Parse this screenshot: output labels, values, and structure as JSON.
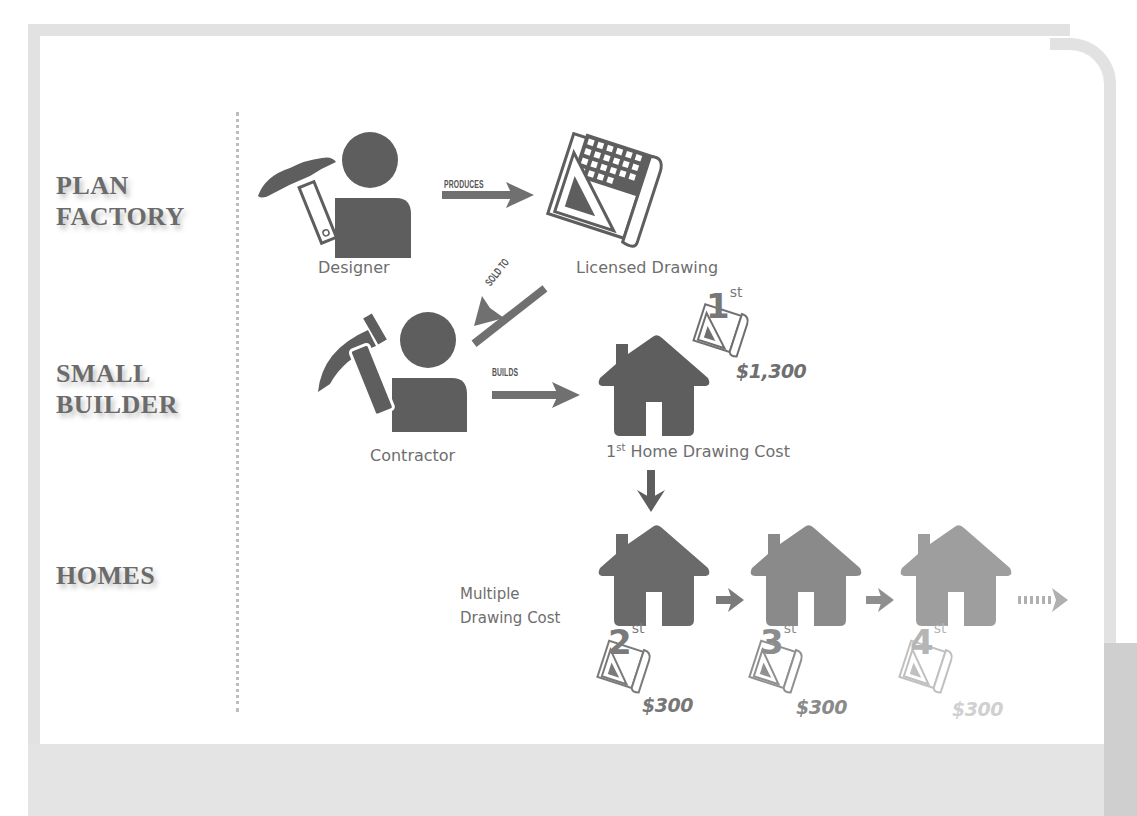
{
  "rows": {
    "plan_factory": "PLAN\nFACTORY",
    "plan_factory_line1": "PLAN",
    "plan_factory_line2": "FACTORY",
    "small_builder_line1": "SMALL",
    "small_builder_line2": "BUILDER",
    "homes": "HOMES"
  },
  "nodes": {
    "designer": "Designer",
    "licensed_drawing": "Licensed Drawing",
    "contractor": "Contractor",
    "first_home_prefix": "1",
    "first_home_sup": "st",
    "first_home_caption": " Home Drawing Cost",
    "multiple_line1": "Multiple",
    "multiple_line2": "Drawing Cost"
  },
  "arrows": {
    "produces": "PRODUCES",
    "sold_to": "SOLD TO",
    "builds": "BUILDS"
  },
  "drawings": [
    {
      "ordinal": "1",
      "suffix": "st",
      "price": "$1,300",
      "shade": "#6f6f6f"
    },
    {
      "ordinal": "2",
      "suffix": "st",
      "price": "$300",
      "shade": "#7a7a7a"
    },
    {
      "ordinal": "3",
      "suffix": "st",
      "price": "$300",
      "shade": "#909090"
    },
    {
      "ordinal": "4",
      "suffix": "st",
      "price": "$300",
      "shade": "#c4c4c4"
    }
  ],
  "colors": {
    "icon_dark": "#5e5e5e",
    "house_2": "#6a6a6a",
    "house_3": "#8a8a8a",
    "house_4": "#9e9e9e",
    "frame": "#e2e2e2",
    "text": "#6e6e6e"
  }
}
